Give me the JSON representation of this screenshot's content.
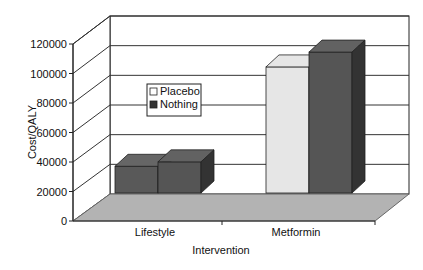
{
  "chart_data": {
    "type": "bar",
    "style": "3d-clustered-column",
    "title": "",
    "xlabel": "Intervention",
    "ylabel": "Cost/QALY",
    "categories": [
      "Lifestyle",
      "Metformin"
    ],
    "series": [
      {
        "name": "Placebo",
        "values": [
          18000,
          85000
        ],
        "color": "#e6e6e6"
      },
      {
        "name": "Nothing",
        "values": [
          21000,
          95000
        ],
        "color": "#555555"
      }
    ],
    "ylim": [
      0,
      120000
    ],
    "yticks": [
      0,
      20000,
      40000,
      60000,
      80000,
      100000,
      120000
    ],
    "ytick_labels": [
      "0",
      "20000",
      "40000",
      "60000",
      "80000",
      "100000",
      "120000"
    ],
    "grid": true,
    "legend_position": "center-left",
    "colors": {
      "floor": "#b3b3b3",
      "placebo_lifestyle": "#595959"
    }
  }
}
